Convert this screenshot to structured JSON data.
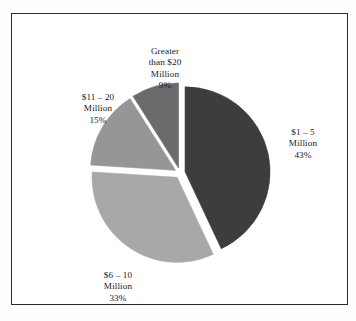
{
  "figure": {
    "background_color": "#fdfdfc",
    "frame_color": "#2b2b2b",
    "plot_background": "#ffffff"
  },
  "chart_data": {
    "type": "pie",
    "title": "",
    "subtitle": "",
    "xlabel": "",
    "ylabel": "",
    "grid": false,
    "legend_position": "none",
    "labels_position": "outside",
    "exploded": true,
    "start_angle_deg": 0,
    "direction": "clockwise",
    "categories": [
      "$1 – 5 Million",
      "$6 – 10 Million",
      "$11 – 20 Million",
      "Greater than $20 Million"
    ],
    "values": [
      43,
      33,
      15,
      9
    ],
    "value_unit": "percent",
    "slices": [
      {
        "name": "$1 – 5 Million",
        "value": 43,
        "percent_label": "43%",
        "color": "#3d3d3d",
        "label_lines": [
          "$1 – 5",
          "Million",
          "43%"
        ]
      },
      {
        "name": "$6 – 10 Million",
        "value": 33,
        "percent_label": "33%",
        "color": "#a8a8a8",
        "label_lines": [
          "$6 – 10",
          "Million",
          "33%"
        ]
      },
      {
        "name": "$11 – 20 Million",
        "value": 15,
        "percent_label": "15%",
        "color": "#969696",
        "label_lines": [
          "$11 – 20",
          "Million",
          "15%"
        ]
      },
      {
        "name": "Greater than $20 Million",
        "value": 9,
        "percent_label": "9%",
        "color": "#6b6b6b",
        "label_lines": [
          "Greater",
          "than $20",
          "Million",
          "9%"
        ]
      }
    ]
  },
  "labels": {
    "gt20": {
      "line1": "Greater",
      "line2": "than $20",
      "line3": "Million",
      "line4": "9%"
    },
    "band_11_20": {
      "line1": "$11 – 20",
      "line2": "Million",
      "line3": "15%"
    },
    "band_1_5": {
      "line1": "$1 – 5",
      "line2": "Million",
      "line3": "43%"
    },
    "band_6_10": {
      "line1": "$6 – 10",
      "line2": "Million",
      "line3": "33%"
    }
  }
}
